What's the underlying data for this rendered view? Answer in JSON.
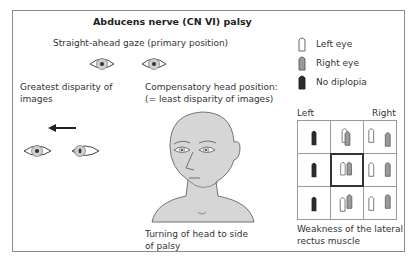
{
  "title": "Abducens nerve (CN VI) palsy",
  "primary_gaze": {
    "label": "Straight-ahead gaze (primary position)"
  },
  "greatest_disparity": {
    "label_line1": "Greatest disparity of",
    "label_line2": "images"
  },
  "compensatory": {
    "label_line1": "Compensatory head position:",
    "label_line2": "(= least disparity of images)",
    "caption_line1": "Turning of head to side",
    "caption_line2": "of palsy"
  },
  "legend": {
    "items": [
      {
        "label": "Left eye",
        "symbol": "outline",
        "color": "#ffffff"
      },
      {
        "label": "Right eye",
        "symbol": "gray",
        "color": "#9a9a9a"
      },
      {
        "label": "No diplopia",
        "symbol": "black",
        "color": "#2a2a2a"
      }
    ]
  },
  "grid": {
    "left_label": "Left",
    "right_label": "Right",
    "caption_line1": "Weakness of the lateral",
    "caption_line2": "rectus muscle",
    "cells": [
      [
        "black",
        "overlap-high",
        "separated"
      ],
      [
        "black",
        "pair-center",
        "separated"
      ],
      [
        "black",
        "overlap-low",
        "separated"
      ]
    ]
  }
}
